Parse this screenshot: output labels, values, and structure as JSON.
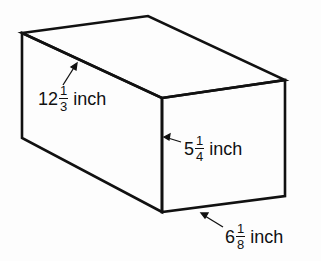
{
  "diagram": {
    "type": "rectangular-prism",
    "dimensions": {
      "length": {
        "whole": "12",
        "numerator": "1",
        "denominator": "3",
        "unit": "inch"
      },
      "height": {
        "whole": "5",
        "numerator": "1",
        "denominator": "4",
        "unit": "inch"
      },
      "width": {
        "whole": "6",
        "numerator": "1",
        "denominator": "8",
        "unit": "inch"
      }
    },
    "line_color": "#111111",
    "background": "#fdfdfd"
  }
}
